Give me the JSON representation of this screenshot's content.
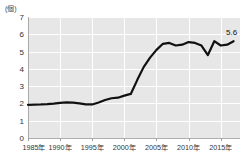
{
  "chart_data": {
    "type": "line",
    "title": "",
    "subtitle": "",
    "xlabel": "",
    "ylabel": "",
    "unit_label": "(個)",
    "ylim": [
      0,
      7
    ],
    "xlim": [
      1985,
      2018
    ],
    "grid": true,
    "legend": false,
    "legend_position": "none",
    "y_ticks": [
      "0",
      "1",
      "2",
      "3",
      "4",
      "5",
      "6",
      "7"
    ],
    "y_tick_values": [
      0,
      1,
      2,
      3,
      4,
      5,
      6,
      7
    ],
    "x_ticks": [
      "1985年",
      "1990年",
      "1995年",
      "2000年",
      "2005年",
      "2010年",
      "2015年"
    ],
    "x_tick_values": [
      1985,
      1990,
      1995,
      2000,
      2005,
      2010,
      2015
    ],
    "colors": {
      "line": "#111111",
      "plot_background": "#e7e7e7",
      "gridline": "#ffffff",
      "axis": "#9a9a9a",
      "text": "#333333",
      "page_background": "#ffffff"
    },
    "annotations": [
      {
        "label": "5.6",
        "x": 2017,
        "y": 5.6
      }
    ],
    "x": [
      1985,
      1986,
      1987,
      1988,
      1989,
      1990,
      1991,
      1992,
      1993,
      1994,
      1995,
      1996,
      1997,
      1998,
      1999,
      2000,
      2001,
      2002,
      2003,
      2004,
      2005,
      2006,
      2007,
      2008,
      2009,
      2010,
      2011,
      2012,
      2013,
      2014,
      2015,
      2016,
      2017
    ],
    "values": [
      1.92,
      1.93,
      1.94,
      1.96,
      1.99,
      2.03,
      2.06,
      2.05,
      2.0,
      1.95,
      1.94,
      2.05,
      2.2,
      2.3,
      2.33,
      2.45,
      2.55,
      3.35,
      4.1,
      4.65,
      5.1,
      5.45,
      5.5,
      5.35,
      5.4,
      5.55,
      5.5,
      5.35,
      4.8,
      5.6,
      5.35,
      5.4,
      5.6
    ],
    "series": [
      {
        "name": "series-1",
        "values": [
          1.92,
          1.93,
          1.94,
          1.96,
          1.99,
          2.03,
          2.06,
          2.05,
          2.0,
          1.95,
          1.94,
          2.05,
          2.2,
          2.3,
          2.33,
          2.45,
          2.55,
          3.35,
          4.1,
          4.65,
          5.1,
          5.45,
          5.5,
          5.35,
          5.4,
          5.55,
          5.5,
          5.35,
          4.8,
          5.6,
          5.35,
          5.4,
          5.6
        ]
      }
    ]
  }
}
